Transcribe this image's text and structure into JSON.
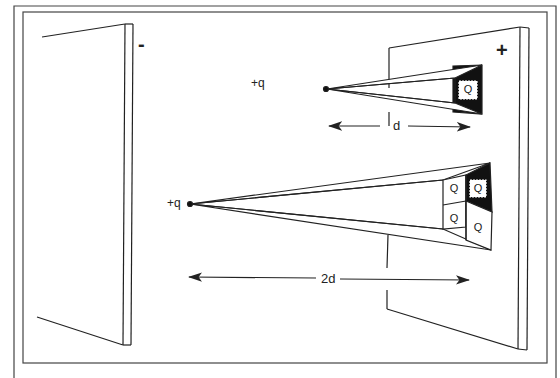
{
  "figure": {
    "plates": {
      "left_sign": "-",
      "right_sign": "+"
    },
    "near_charge": {
      "label": "+q",
      "distance_label": "d",
      "cells": [
        "Q"
      ]
    },
    "far_charge": {
      "label": "+q",
      "distance_label": "2d",
      "cells": [
        "Q",
        "Q",
        "Q",
        "Q"
      ]
    },
    "colors": {
      "line": "#222222",
      "fill_dark": "#111111",
      "background": "#ffffff",
      "frame": "#444444"
    }
  }
}
